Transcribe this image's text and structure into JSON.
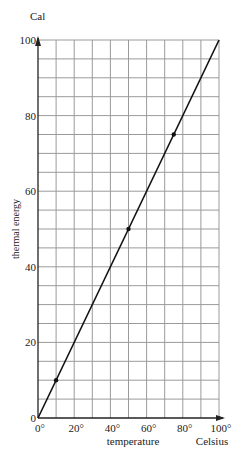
{
  "chart_data": {
    "type": "line",
    "title": "",
    "xlabel": "temperature",
    "xunit": "Celsius",
    "ylabel": "thermal energy",
    "yunit": "Cal",
    "xlim": [
      0,
      100
    ],
    "ylim": [
      0,
      100
    ],
    "x_ticks": [
      "0°",
      "20°",
      "40°",
      "60°",
      "80°",
      "100°"
    ],
    "y_ticks": [
      "0",
      "20",
      "40",
      "60",
      "80",
      "100"
    ],
    "grid": true,
    "grid_x_step": 10,
    "grid_y_step": 5,
    "series": [
      {
        "name": "thermal energy vs temperature",
        "line": {
          "x": [
            0,
            100
          ],
          "y": [
            0,
            100
          ]
        },
        "points": [
          {
            "x": 10,
            "y": 10
          },
          {
            "x": 50,
            "y": 50
          },
          {
            "x": 75,
            "y": 75
          }
        ]
      }
    ],
    "colors": {
      "grid": "#9a9a9a",
      "line": "#111111",
      "axis": "#222222"
    }
  }
}
